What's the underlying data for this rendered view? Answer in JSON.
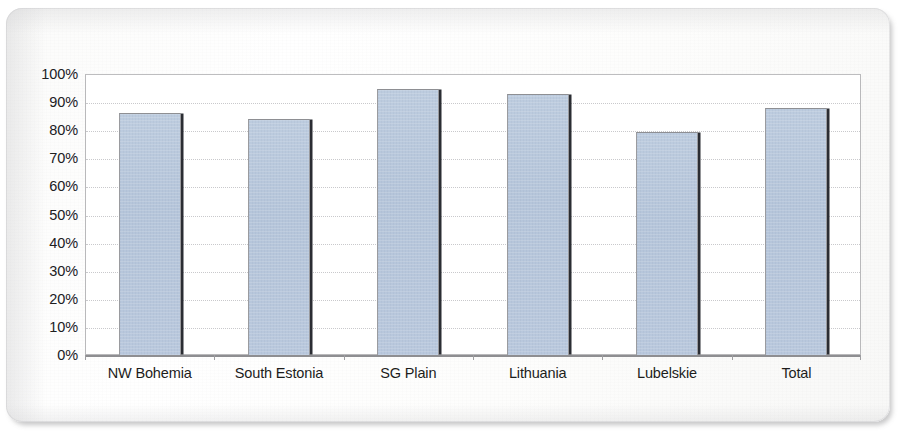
{
  "chart_data": {
    "type": "bar",
    "title": "",
    "subtitle": "",
    "xlabel": "",
    "ylabel": "",
    "categories": [
      "NW Bohemia",
      "South Estonia",
      "SG Plain",
      "Lithuania",
      "Lubelskie",
      "Total"
    ],
    "values": [
      86,
      84,
      94.5,
      93,
      79.5,
      88
    ],
    "ylim": [
      0,
      100
    ],
    "y_tick_labels": [
      "100%",
      "90%",
      "80%",
      "70%",
      "60%",
      "50%",
      "40%",
      "30%",
      "20%",
      "10%",
      "0%"
    ],
    "y_tick_values": [
      100,
      90,
      80,
      70,
      60,
      50,
      40,
      30,
      20,
      10,
      0
    ],
    "value_format": "percent",
    "grid": true,
    "grid_axis": "y",
    "grid_style": "dotted",
    "legend": false,
    "legend_position": "none",
    "series": [
      {
        "name": "",
        "values": [
          86,
          84,
          94.5,
          93,
          79.5,
          88
        ]
      }
    ],
    "colors": {
      "bar_fill": "#b5c5da",
      "bar_border": "#9a9b9f",
      "bar_shadow": "#2b2d33",
      "gridline": "#c9c9cc",
      "axis": "#8e8e91",
      "plot_background": "#ffffff",
      "page_background": "#fbfbfa",
      "text": "#20201f"
    }
  }
}
